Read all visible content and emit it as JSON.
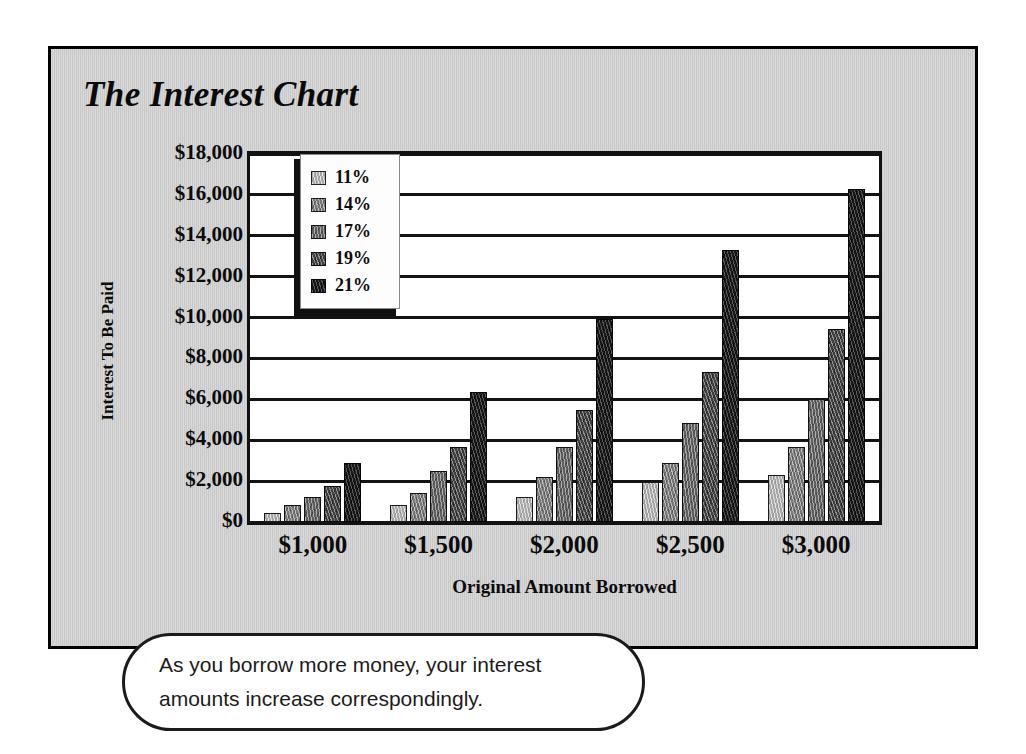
{
  "title": "The Interest Chart",
  "caption": "As you borrow more money, your interest amounts increase correspondingly.",
  "colors": {
    "panel_background": "#cfcfcf",
    "page_background": "#ffffff",
    "frame_border": "#000000",
    "plot_background": "#ffffff",
    "axis_line": "#131313",
    "text": "#0b0b0b",
    "series_swatches": [
      "#b9b9b9",
      "#8d8d8d",
      "#767676",
      "#545454",
      "#232323"
    ]
  },
  "chart_data": {
    "type": "bar",
    "title": "The Interest Chart",
    "xlabel": "Original Amount Borrowed",
    "ylabel": "Interest To Be Paid",
    "categories": [
      "$1,000",
      "$1,500",
      "$2,000",
      "$2,500",
      "$3,000"
    ],
    "ylim": [
      0,
      18000
    ],
    "ytick_labels": [
      "$0",
      "$2,000",
      "$4,000",
      "$6,000",
      "$8,000",
      "$10,000",
      "$12,000",
      "$14,000",
      "$16,000",
      "$18,000"
    ],
    "ytick_values": [
      0,
      2000,
      4000,
      6000,
      8000,
      10000,
      12000,
      14000,
      16000,
      18000
    ],
    "grid": true,
    "legend_position": "top-left-inside",
    "series": [
      {
        "name": "11%",
        "values": [
          440,
          830,
          1200,
          1950,
          2300
        ]
      },
      {
        "name": "14%",
        "values": [
          840,
          1400,
          2200,
          2900,
          3650
        ]
      },
      {
        "name": "17%",
        "values": [
          1230,
          2500,
          3650,
          4850,
          6000
        ]
      },
      {
        "name": "19%",
        "values": [
          1750,
          3650,
          5500,
          7350,
          9450
        ]
      },
      {
        "name": "21%",
        "values": [
          2900,
          6350,
          9950,
          13300,
          16300
        ]
      }
    ]
  }
}
